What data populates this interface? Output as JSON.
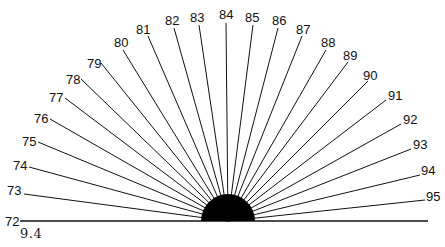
{
  "figure": {
    "caption": "9.4",
    "center": {
      "x": 228,
      "y": 221
    },
    "semicircle_radius": 27,
    "baseline": {
      "x1": 20,
      "x2": 428
    },
    "fill_color": "#000000",
    "line_color": "#111111",
    "rays": [
      {
        "label": "72",
        "lx": 5,
        "ly": 226,
        "ex": 20,
        "ey": 221
      },
      {
        "label": "73",
        "lx": 7,
        "ly": 195,
        "ex": 24,
        "ey": 194
      },
      {
        "label": "74",
        "lx": 13,
        "ly": 170,
        "ex": 29,
        "ey": 167
      },
      {
        "label": "75",
        "lx": 22,
        "ly": 146,
        "ex": 38,
        "ey": 142
      },
      {
        "label": "76",
        "lx": 34,
        "ly": 123,
        "ex": 50,
        "ey": 119
      },
      {
        "label": "77",
        "lx": 49,
        "ly": 102,
        "ex": 65,
        "ey": 98
      },
      {
        "label": "78",
        "lx": 66,
        "ly": 84,
        "ex": 81,
        "ey": 79
      },
      {
        "label": "79",
        "lx": 87,
        "ly": 68,
        "ex": 101,
        "ey": 63
      },
      {
        "label": "80",
        "lx": 114,
        "ly": 47,
        "ex": 123,
        "ey": 50
      },
      {
        "label": "81",
        "lx": 136,
        "ly": 34,
        "ex": 148,
        "ey": 36
      },
      {
        "label": "82",
        "lx": 165,
        "ly": 25,
        "ex": 174,
        "ey": 28
      },
      {
        "label": "83",
        "lx": 190,
        "ly": 22,
        "ex": 199,
        "ey": 25
      },
      {
        "label": "84",
        "lx": 219,
        "ly": 19,
        "ex": 226,
        "ey": 23
      },
      {
        "label": "85",
        "lx": 245,
        "ly": 22,
        "ex": 253,
        "ey": 25
      },
      {
        "label": "86",
        "lx": 272,
        "ly": 25,
        "ex": 278,
        "ey": 28
      },
      {
        "label": "87",
        "lx": 296,
        "ly": 34,
        "ex": 302,
        "ey": 36
      },
      {
        "label": "88",
        "lx": 321,
        "ly": 47,
        "ex": 326,
        "ey": 50
      },
      {
        "label": "89",
        "lx": 343,
        "ly": 60,
        "ex": 348,
        "ey": 62
      },
      {
        "label": "90",
        "lx": 363,
        "ly": 80,
        "ex": 368,
        "ey": 81
      },
      {
        "label": "91",
        "lx": 388,
        "ly": 100,
        "ex": 386,
        "ey": 100
      },
      {
        "label": "92",
        "lx": 403,
        "ly": 124,
        "ex": 401,
        "ey": 124
      },
      {
        "label": "93",
        "lx": 413,
        "ly": 149,
        "ex": 411,
        "ey": 149
      },
      {
        "label": "94",
        "lx": 421,
        "ly": 175,
        "ex": 420,
        "ey": 175
      },
      {
        "label": "95",
        "lx": 426,
        "ly": 201,
        "ex": 425,
        "ey": 200
      }
    ]
  }
}
